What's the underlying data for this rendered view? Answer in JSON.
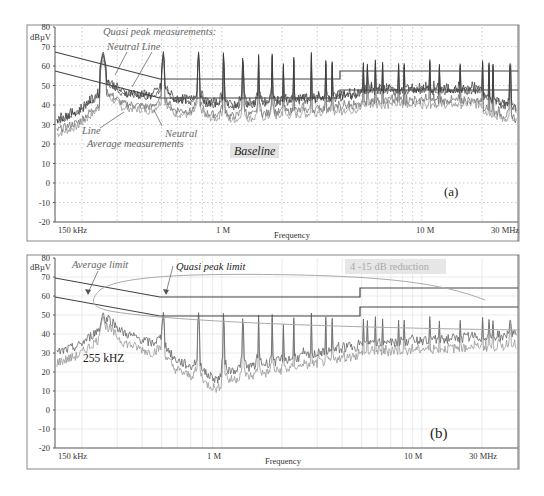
{
  "chart_data": [
    {
      "panel": "(a)",
      "type": "line",
      "title": "Baseline",
      "xlabel": "Frequency",
      "ylabel": "dBµV",
      "xscale": "log",
      "xlim_hz": [
        150000,
        30000000
      ],
      "ylim": [
        -20,
        80
      ],
      "grid": true,
      "grid_style": "dotted",
      "x_tick_labels": [
        "150 kHz",
        "1 M",
        "10 M",
        "30 MHz"
      ],
      "y_tick_labels": [
        "80",
        "70",
        "60",
        "50",
        "40",
        "30",
        "20",
        "10",
        "0",
        "-10",
        "-20"
      ],
      "annotations": [
        "Quasi peak measurements:",
        "Neutral",
        "Line",
        "Line",
        "Neutral",
        "Average measurements",
        "Baseline",
        "(a)"
      ],
      "limits": [
        {
          "name": "Quasi peak limit",
          "points_hz_db": [
            [
              150000,
              66
            ],
            [
              500000,
              56
            ],
            [
              5000000,
              56
            ],
            [
              5000000,
              60
            ],
            [
              30000000,
              60
            ]
          ]
        },
        {
          "name": "Average limit",
          "points_hz_db": [
            [
              150000,
              56
            ],
            [
              500000,
              46
            ],
            [
              5000000,
              46
            ],
            [
              5000000,
              50
            ],
            [
              30000000,
              50
            ]
          ]
        }
      ],
      "series": [
        {
          "name": "Quasi peak - Neutral",
          "description": "harmonic peaks every ~255 kHz reaching ~60-68 dBµV; floor ~35-50 dBµV rising to ~50 dBµV above 5 MHz"
        },
        {
          "name": "Quasi peak - Line",
          "description": "similar to neutral, slightly lower"
        },
        {
          "name": "Average - Line",
          "description": "floor ~30-45 dBµV with harmonic peaks"
        },
        {
          "name": "Average - Neutral",
          "description": "floor ~28-42 dBµV with harmonic peaks"
        }
      ],
      "key_points": [
        {
          "freq_hz": 150000,
          "qp_db": 33,
          "avg_db": 24
        },
        {
          "freq_hz": 255000,
          "peak_db": 68
        },
        {
          "freq_hz": 510000,
          "peak_db": 65
        },
        {
          "freq_hz": 765000,
          "peak_db": 71
        },
        {
          "freq_hz": 30000000,
          "floor_db": 25
        }
      ]
    },
    {
      "panel": "(b)",
      "type": "line",
      "title": "4 -15 dB reduction",
      "xlabel": "Frequency",
      "ylabel": "dBµV",
      "xscale": "log",
      "xlim_hz": [
        150000,
        30000000
      ],
      "ylim": [
        -20,
        80
      ],
      "grid": true,
      "grid_style": "solid-light",
      "x_tick_labels": [
        "150 kHz",
        "1 M",
        "10 M",
        "30 MHz"
      ],
      "y_tick_labels": [
        "80",
        "70",
        "60",
        "50",
        "40",
        "30",
        "20",
        "10",
        "0",
        "-10",
        "-20"
      ],
      "annotations": [
        "Average limit",
        "Quasi peak limit",
        "255 kHZ",
        "4 -15 dB reduction",
        "(b)"
      ],
      "limits": [
        {
          "name": "Quasi peak limit",
          "points_hz_db": [
            [
              150000,
              66
            ],
            [
              500000,
              56
            ],
            [
              5000000,
              56
            ],
            [
              5000000,
              60
            ],
            [
              30000000,
              60
            ]
          ]
        },
        {
          "name": "Average limit",
          "points_hz_db": [
            [
              150000,
              56
            ],
            [
              500000,
              46
            ],
            [
              5000000,
              46
            ],
            [
              5000000,
              50
            ],
            [
              30000000,
              50
            ]
          ]
        }
      ],
      "series": [
        {
          "name": "Quasi peak measurement",
          "description": "starts ~33 dBµV, 255 kHz peak ~63 dBµV, decreasing to ~10 dBµV dip near 1 MHz, harmonic peaks ~45-50 dBµV above 1 MHz"
        },
        {
          "name": "Average measurement",
          "description": "starts ~28 dBµV, dips to ~6 dBµV near 1 MHz"
        }
      ],
      "key_points": [
        {
          "freq_hz": 150000,
          "qp_db": 33,
          "avg_db": 28
        },
        {
          "freq_hz": 255000,
          "peak_db": 63
        },
        {
          "freq_hz": 1000000,
          "min_db": 6
        },
        {
          "freq_hz": 30000000,
          "floor_db": 33
        }
      ]
    }
  ],
  "panel_a": {
    "ylabel": "dBµV",
    "xlabel": "Frequency",
    "x_ticks": [
      "150 kHz",
      "1 M",
      "10 M",
      "30 MHz"
    ],
    "y_ticks": [
      "80",
      "70",
      "60",
      "50",
      "40",
      "30",
      "20",
      "10",
      "0",
      "-10",
      "-20"
    ],
    "ann_qp": "Quasi peak measurements:",
    "ann_neutral_line": "Neutral  Line",
    "ann_line": "Line",
    "ann_neutral": "Neutral",
    "ann_avg": "Average measurements",
    "baseline": "Baseline",
    "panel_label": "(a)"
  },
  "panel_b": {
    "ylabel": "dBµV",
    "xlabel": "Frequency",
    "x_ticks": [
      "150 kHz",
      "1 M",
      "10 M",
      "30 MHz"
    ],
    "y_ticks": [
      "80",
      "70",
      "60",
      "50",
      "40",
      "30",
      "20",
      "10",
      "0",
      "-10",
      "-20"
    ],
    "ann_avg_limit": "Average limit",
    "ann_qp_limit": "Quasi peak limit",
    "ann_255": "255 kHZ",
    "reduction": "4 -15 dB reduction",
    "panel_label": "(b)"
  }
}
